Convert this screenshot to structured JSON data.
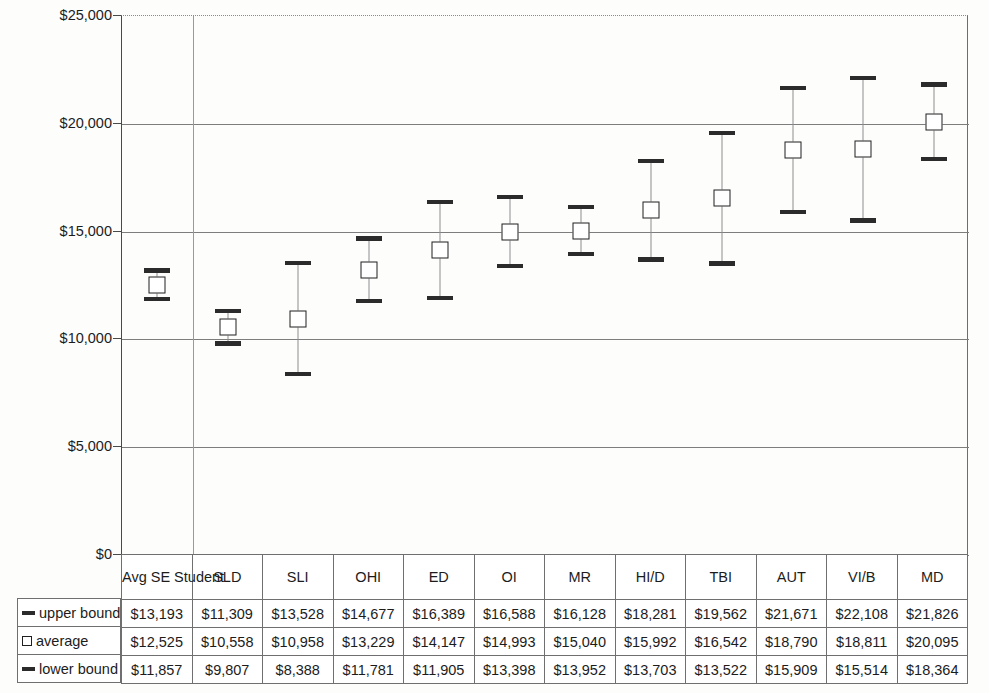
{
  "chart_data": {
    "type": "bar",
    "title": "",
    "subtitle": "",
    "xlabel": "",
    "ylabel": "",
    "ylim": [
      0,
      25000
    ],
    "y_ticks": [
      "$0",
      "$5,000",
      "$10,000",
      "$15,000",
      "$20,000",
      "$25,000"
    ],
    "y_tick_values": [
      0,
      5000,
      10000,
      15000,
      20000,
      25000
    ],
    "grid": true,
    "legend_position": "table-left",
    "categories": [
      "Avg SE Student",
      "SLD",
      "SLI",
      "OHI",
      "ED",
      "OI",
      "MR",
      "HI/D",
      "TBI",
      "AUT",
      "VI/B",
      "MD"
    ],
    "series": [
      {
        "name": "upper bound",
        "marker": "dash",
        "values": [
          13193,
          11309,
          13528,
          14677,
          16389,
          16588,
          16128,
          18281,
          19562,
          21671,
          22108,
          21826
        ],
        "labels": [
          "$13,193",
          "$11,309",
          "$13,528",
          "$14,677",
          "$16,389",
          "$16,588",
          "$16,128",
          "$18,281",
          "$19,562",
          "$21,671",
          "$22,108",
          "$21,826"
        ]
      },
      {
        "name": "average",
        "marker": "square",
        "values": [
          12525,
          10558,
          10958,
          13229,
          14147,
          14993,
          15040,
          15992,
          16542,
          18790,
          18811,
          20095
        ],
        "labels": [
          "$12,525",
          "$10,558",
          "$10,958",
          "$13,229",
          "$14,147",
          "$14,993",
          "$15,040",
          "$15,992",
          "$16,542",
          "$18,790",
          "$18,811",
          "$20,095"
        ]
      },
      {
        "name": "lower bound",
        "marker": "dash",
        "values": [
          11857,
          9807,
          8388,
          11781,
          11905,
          13398,
          13952,
          13703,
          13522,
          15909,
          15514,
          18364
        ],
        "labels": [
          "$11,857",
          "$9,807",
          "$8,388",
          "$11,781",
          "$11,905",
          "$13,398",
          "$13,952",
          "$13,703",
          "$13,522",
          "$15,909",
          "$15,514",
          "$18,364"
        ]
      }
    ],
    "colors": {
      "marker": "#2b2b2b",
      "line": "#8d8d8d",
      "average_fill": "#ffffff",
      "average_border": "#1f1f1f",
      "grid": "#7d7d7d",
      "axis": "#4a4a4a"
    }
  }
}
